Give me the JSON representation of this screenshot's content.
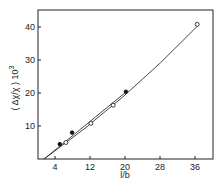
{
  "chart_data": {
    "type": "scatter",
    "title": "",
    "xlabel": "l/b",
    "ylabel": "( Δχ/χ ) 10³",
    "xlim": [
      0,
      40
    ],
    "ylim": [
      0,
      45
    ],
    "xticks": [
      4,
      12,
      20,
      28,
      36
    ],
    "yticks": [
      10,
      20,
      30,
      40
    ],
    "grid": false,
    "legend": null,
    "series": [
      {
        "name": "filled circles",
        "marker": "filled-circle",
        "x": [
          5.1,
          7.9,
          20.2
        ],
        "y": [
          4.5,
          8.0,
          20.4
        ],
        "fit_line": {
          "type": "linear",
          "from": [
            1.5,
            0
          ],
          "to": [
            20.5,
            20.6
          ]
        }
      },
      {
        "name": "open circles",
        "marker": "open-circle",
        "x": [
          6.5,
          12.2,
          17.3,
          36.5
        ],
        "y": [
          5.0,
          10.8,
          16.3,
          40.8
        ],
        "fit_line": {
          "type": "curve",
          "from": [
            1.5,
            0
          ],
          "to": [
            36.5,
            40.2
          ]
        }
      }
    ]
  },
  "axes": {
    "xlabel": "l/b",
    "ylabel": "( Δχ/χ ) 10",
    "ylabel_exp": "3",
    "xticks": [
      "4",
      "12",
      "20",
      "28",
      "36"
    ],
    "yticks": [
      "10",
      "20",
      "30",
      "40"
    ]
  }
}
